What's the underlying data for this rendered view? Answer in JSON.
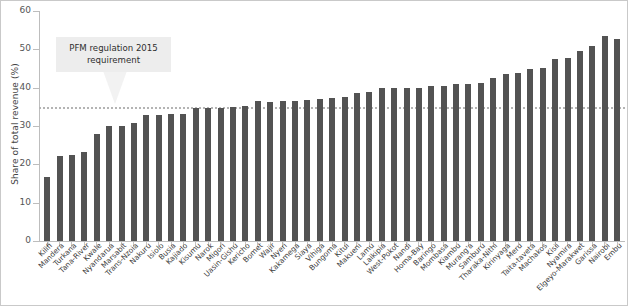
{
  "chart_data": {
    "type": "bar",
    "title": "",
    "xlabel": "",
    "ylabel": "Share of total revenue (%)",
    "ylim": [
      0,
      60
    ],
    "yticks": [
      0,
      10,
      20,
      30,
      40,
      50,
      60
    ],
    "grid": false,
    "legend": null,
    "bar_color": "#535353",
    "annotations": [
      {
        "text_line1": "PFM regulation 2015",
        "text_line2": "requirement",
        "points_to_value": 35,
        "box_color": "#ededed"
      }
    ],
    "reference_lines": [
      {
        "value": 35,
        "style": "dotted",
        "color": "#b4b4b4"
      }
    ],
    "categories": [
      "Kilifi",
      "Mandera",
      "Turkana",
      "Tana-River",
      "Kwale",
      "Nyandarua",
      "Marsabit",
      "Trans-Nzoia",
      "Nakuru",
      "Isiolo",
      "Busia",
      "Kajiado",
      "Kisumu",
      "Narok",
      "Migori",
      "Uasin-Gishu",
      "Kericho",
      "Bomet",
      "Wajir",
      "Nyeri",
      "Kakamega",
      "Siaya",
      "Vihiga",
      "Bungoma",
      "Kitui",
      "Makueni",
      "Lamu",
      "Laikipia",
      "West-Pokot",
      "Nandi",
      "Homa-Bay",
      "Baringo",
      "Mombasa",
      "Kiambu",
      "Murang'a",
      "Samburu",
      "Tharaka-Nithi",
      "Kirinyaga",
      "Meru",
      "Taita-taveta",
      "Machakos",
      "Kisii",
      "Nyamira",
      "Elgeyo-Marakwet",
      "Garissa",
      "Nairobi",
      "Embu"
    ],
    "values": [
      16.8,
      22.2,
      22.5,
      23.2,
      27.8,
      30.0,
      30.0,
      30.8,
      32.8,
      33.0,
      33.2,
      33.2,
      34.8,
      34.8,
      34.8,
      35.0,
      35.2,
      36.6,
      36.2,
      36.4,
      36.4,
      36.8,
      37.0,
      37.2,
      37.6,
      38.6,
      38.8,
      39.8,
      40.0,
      39.8,
      40.0,
      40.4,
      40.4,
      41.0,
      41.0,
      41.2,
      42.6,
      43.6,
      43.8,
      44.8,
      45.2,
      47.6,
      47.8,
      49.6,
      51.0,
      53.4,
      52.6
    ]
  }
}
